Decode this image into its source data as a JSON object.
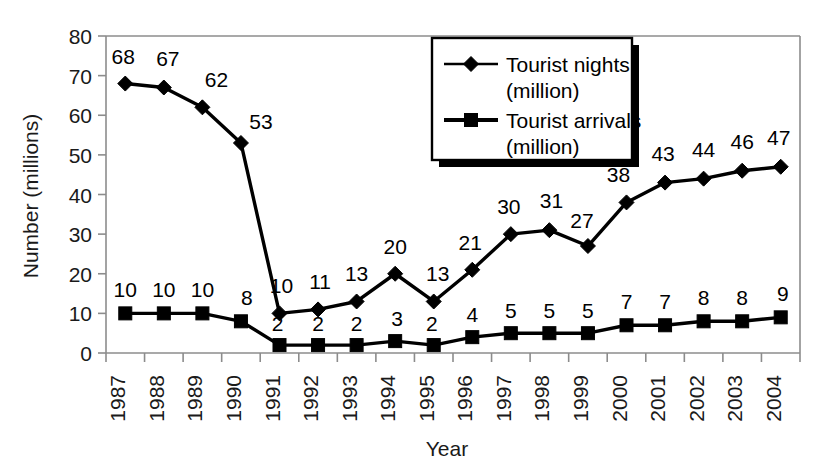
{
  "chart_data": {
    "type": "line",
    "title": "",
    "xlabel": "Year",
    "ylabel": "Number (millions)",
    "ylim": [
      0,
      80
    ],
    "yticks": [
      0,
      10,
      20,
      30,
      40,
      50,
      60,
      70,
      80
    ],
    "grid": false,
    "legend_position": "top-right",
    "categories": [
      "1987",
      "1988",
      "1989",
      "1990",
      "1991",
      "1992",
      "1993",
      "1994",
      "1995",
      "1996",
      "1997",
      "1998",
      "1999",
      "2000",
      "2001",
      "2002",
      "2003",
      "2004"
    ],
    "series": [
      {
        "name": "Tourist nights (million)",
        "marker": "diamond",
        "values": [
          68,
          67,
          62,
          53,
          10,
          11,
          13,
          20,
          13,
          21,
          30,
          31,
          27,
          38,
          43,
          44,
          46,
          47
        ]
      },
      {
        "name": "Tourist arrivals (million)",
        "marker": "square",
        "values": [
          10,
          10,
          10,
          8,
          2,
          2,
          2,
          3,
          2,
          4,
          5,
          5,
          5,
          7,
          7,
          8,
          8,
          9
        ]
      }
    ]
  },
  "legend": {
    "entries": [
      {
        "line1": "Tourist nights",
        "line2": "(million)",
        "marker": "diamond"
      },
      {
        "line1": "Tourist arrivals",
        "line2": "(million)",
        "marker": "square"
      }
    ]
  },
  "axes": {
    "y_title": "Number (millions)",
    "x_title": "Year",
    "y_tick_labels": [
      "0",
      "10",
      "20",
      "30",
      "40",
      "50",
      "60",
      "70",
      "80"
    ],
    "x_tick_labels": [
      "1987",
      "1988",
      "1989",
      "1990",
      "1991",
      "1992",
      "1993",
      "1994",
      "1995",
      "1996",
      "1997",
      "1998",
      "1999",
      "2000",
      "2001",
      "2002",
      "2003",
      "2004"
    ]
  },
  "colors": {
    "series_stroke": "#000000",
    "axis": "#8c8c8c",
    "background": "#ffffff",
    "text": "#1a1a1a"
  }
}
